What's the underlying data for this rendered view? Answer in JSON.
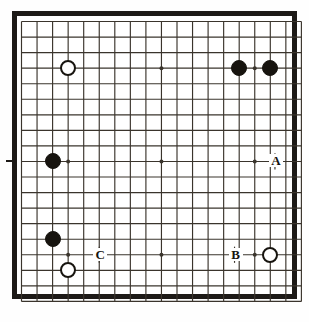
{
  "figure": {
    "kind": "go-board-diagram",
    "board_size": 19,
    "caption": ""
  },
  "style": {
    "line_color": "#3a342c",
    "frame_color": "#1d1a17",
    "black_stone_color": "#17140f",
    "white_stone_color": "#ffffff",
    "white_stone_outline": "#17140f",
    "board_color": "#ffffff"
  },
  "geometry": {
    "origin_x": 21.5,
    "origin_y": 21.5,
    "spacing": 15.55,
    "stone_radius": 8.0,
    "star_radius": 2.0
  },
  "star_points": [
    {
      "col": 4,
      "row": 4
    },
    {
      "col": 10,
      "row": 4
    },
    {
      "col": 16,
      "row": 4
    },
    {
      "col": 4,
      "row": 10
    },
    {
      "col": 10,
      "row": 10
    },
    {
      "col": 16,
      "row": 10
    },
    {
      "col": 4,
      "row": 16
    },
    {
      "col": 10,
      "row": 16
    },
    {
      "col": 16,
      "row": 16
    }
  ],
  "stones": [
    {
      "id": "w1",
      "color": "white",
      "col": 4,
      "row": 4
    },
    {
      "id": "b1",
      "color": "black",
      "col": 15,
      "row": 4
    },
    {
      "id": "b2",
      "color": "black",
      "col": 17,
      "row": 4
    },
    {
      "id": "b3",
      "color": "black",
      "col": 3,
      "row": 10
    },
    {
      "id": "b4",
      "color": "black",
      "col": 3,
      "row": 15
    },
    {
      "id": "w2",
      "color": "white",
      "col": 4,
      "row": 17
    },
    {
      "id": "w3",
      "color": "white",
      "col": 17,
      "row": 16
    }
  ],
  "labels": [
    {
      "id": "A",
      "text": "A",
      "col": 16,
      "row": 10,
      "offset_cols": 1.3
    },
    {
      "id": "B",
      "text": "B",
      "col": 16,
      "row": 16,
      "offset_cols": -1.3
    },
    {
      "id": "C",
      "text": "C",
      "col": 6,
      "row": 16,
      "offset_cols": 0
    }
  ],
  "edge_ticks": [
    {
      "row": 10
    }
  ]
}
